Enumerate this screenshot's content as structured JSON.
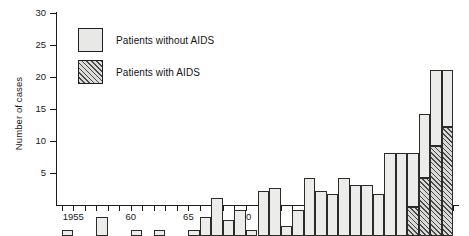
{
  "chart_data": {
    "type": "bar",
    "title": "",
    "xlabel": "",
    "ylabel": "Number of cases",
    "ylim": [
      0,
      30
    ],
    "ytick_values": [
      0,
      5,
      10,
      15,
      20,
      25,
      30
    ],
    "ytick_labels": [
      "",
      "5",
      "10",
      "15",
      "20",
      "25",
      "30"
    ],
    "xlim": [
      1953.5,
      1988.5
    ],
    "xtick_values": [
      1955,
      1960,
      1965,
      1970,
      1975,
      1980,
      1985
    ],
    "xtick_labels": [
      "1955",
      "60",
      "65",
      "70",
      "75",
      "80",
      "85"
    ],
    "grid": false,
    "legend_position": "upper-left-inside",
    "stacked": true,
    "bar_outline_color": "#2b2b2b",
    "categories": [
      1954,
      1955,
      1956,
      1957,
      1958,
      1959,
      1960,
      1961,
      1962,
      1963,
      1964,
      1965,
      1966,
      1967,
      1968,
      1969,
      1970,
      1971,
      1972,
      1973,
      1974,
      1975,
      1976,
      1977,
      1978,
      1979,
      1980,
      1981,
      1982,
      1983,
      1984,
      1985,
      1986,
      1987
    ],
    "series": [
      {
        "name": "Patients without AIDS",
        "color": "#ececeb",
        "fill": "solid",
        "values": [
          1,
          0,
          0,
          3,
          0,
          0,
          1,
          0,
          1,
          0,
          0,
          1,
          3,
          6,
          2.5,
          4,
          1,
          7,
          7.5,
          1.5,
          4,
          9,
          7,
          6.5,
          9,
          8,
          8,
          6.5,
          13,
          13,
          8.5,
          10,
          12,
          9
        ]
      },
      {
        "name": "Patients with AIDS",
        "color": "#d9d9d7",
        "fill": "diagonal-hatch",
        "values": [
          0,
          0,
          0,
          0,
          0,
          0,
          0,
          0,
          0,
          0,
          0,
          0,
          0,
          0,
          0,
          0,
          0,
          0,
          0,
          0,
          0,
          0,
          0,
          0,
          0,
          0,
          0,
          0,
          0,
          0,
          4.5,
          9,
          14,
          17
        ]
      }
    ],
    "totals": [
      1,
      0,
      0,
      3,
      0,
      0,
      1,
      0,
      1,
      0,
      0,
      1,
      3,
      6,
      2.5,
      4,
      1,
      7,
      7.5,
      1.5,
      4,
      9,
      7,
      6.5,
      9,
      8,
      8,
      6.5,
      13,
      13,
      13,
      19,
      26,
      26
    ]
  },
  "legend": {
    "items": [
      {
        "label": "Patients without AIDS",
        "fill": "solid"
      },
      {
        "label": "Patients with AIDS",
        "fill": "diagonal-hatch"
      }
    ]
  }
}
